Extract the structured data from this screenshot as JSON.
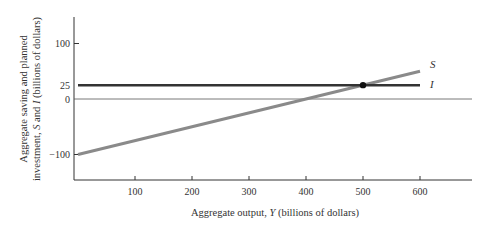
{
  "chart_data": {
    "type": "line",
    "title": "",
    "xlabel": "Aggregate output, Y (billions of dollars)",
    "xlabel_parts": {
      "pre": "Aggregate output, ",
      "var": "Y",
      "post": " (billions of dollars)"
    },
    "ylabel_line1": "Aggregate saving and planned",
    "ylabel_line2_parts": {
      "pre": "investment, ",
      "var1": "S",
      "mid": " and ",
      "var2": "I",
      "post": " (billions of dollars)"
    },
    "ylabel": "Aggregate saving and planned investment, S and I (billions of dollars)",
    "x_ticks": [
      100,
      200,
      300,
      400,
      500,
      600
    ],
    "y_ticks": [
      100,
      25,
      0,
      -100
    ],
    "xlim": [
      0,
      690
    ],
    "ylim": [
      -145,
      150
    ],
    "grid": false,
    "series": [
      {
        "name": "S",
        "color": "#8a8a8a",
        "x": [
          0,
          600
        ],
        "values": [
          -100,
          50
        ]
      },
      {
        "name": "I",
        "color": "#333333",
        "x": [
          0,
          600
        ],
        "values": [
          25,
          25
        ]
      }
    ],
    "annotations": [
      {
        "type": "point",
        "label": "equilibrium",
        "x": 500,
        "y": 25
      }
    ],
    "zero_line": true
  }
}
